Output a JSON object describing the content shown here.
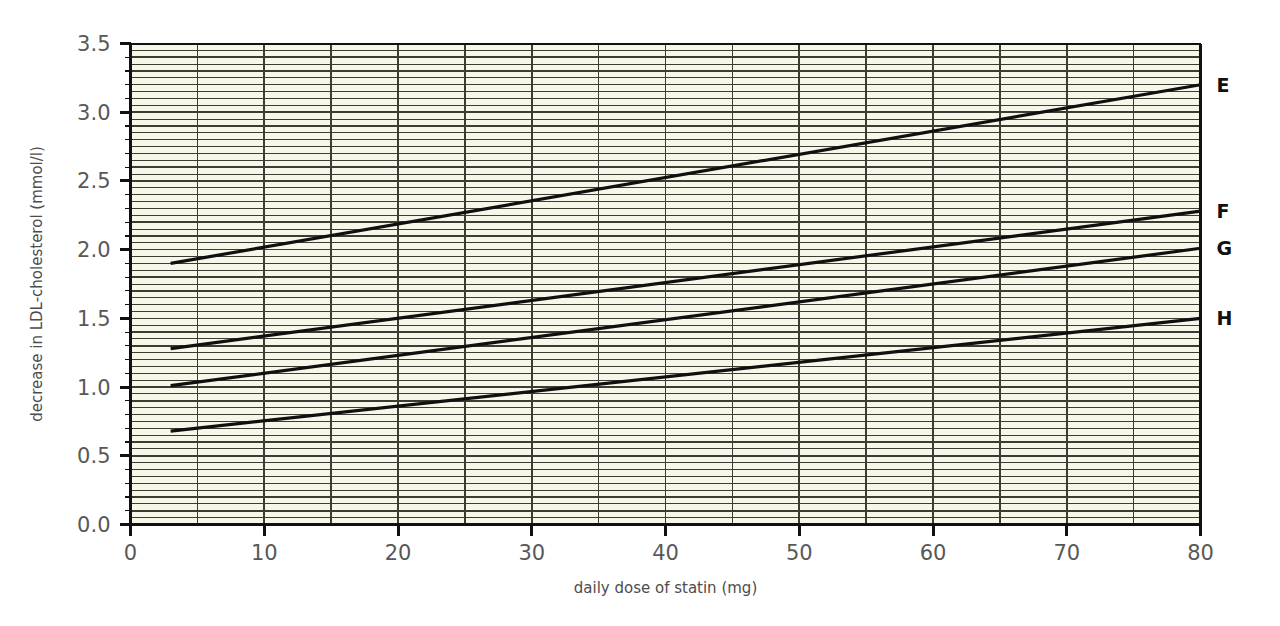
{
  "chart_data": {
    "type": "line",
    "title": "",
    "subtitle": "",
    "xlabel": "daily dose of statin (mg)",
    "ylabel": "decrease in LDL-cholesterol (mmol/l)",
    "xlim": [
      0,
      80
    ],
    "ylim": [
      0,
      3.5
    ],
    "x_major_ticks": [
      0,
      10,
      20,
      30,
      40,
      50,
      60,
      70,
      80
    ],
    "x_tick_labels": [
      "0",
      "10",
      "20",
      "30",
      "40",
      "50",
      "60",
      "70",
      "80"
    ],
    "y_major_ticks": [
      0.0,
      0.5,
      1.0,
      1.5,
      2.0,
      2.5,
      3.0,
      3.5
    ],
    "y_tick_labels": [
      "0.0",
      "0.5",
      "1.0",
      "1.5",
      "2.0",
      "2.5",
      "3.0",
      "3.5"
    ],
    "x_gridline_step": 5,
    "y_gridline_step": 0.05,
    "y_minor_tick_step": 0.1,
    "grid": true,
    "legend_position": "right-inline",
    "plot_background": "#f7f6e9",
    "gridline_color": "#3c3c32",
    "line_color": "#101010",
    "series": [
      {
        "name": "E",
        "label": "E",
        "x": [
          3,
          80
        ],
        "values": [
          1.9,
          3.2
        ],
        "start_point": {
          "x": 3,
          "y": 1.9
        },
        "end_point": {
          "x": 80,
          "y": 3.2
        }
      },
      {
        "name": "F",
        "label": "F",
        "x": [
          3,
          80
        ],
        "values": [
          1.28,
          2.28
        ],
        "start_point": {
          "x": 3,
          "y": 1.28
        },
        "end_point": {
          "x": 80,
          "y": 2.28
        }
      },
      {
        "name": "G",
        "label": "G",
        "x": [
          3,
          80
        ],
        "values": [
          1.01,
          2.01
        ],
        "start_point": {
          "x": 3,
          "y": 1.01
        },
        "end_point": {
          "x": 80,
          "y": 2.01
        }
      },
      {
        "name": "H",
        "label": "H",
        "x": [
          3,
          80
        ],
        "values": [
          0.68,
          1.5
        ],
        "start_point": {
          "x": 3,
          "y": 0.68
        },
        "end_point": {
          "x": 80,
          "y": 1.5
        }
      }
    ]
  }
}
